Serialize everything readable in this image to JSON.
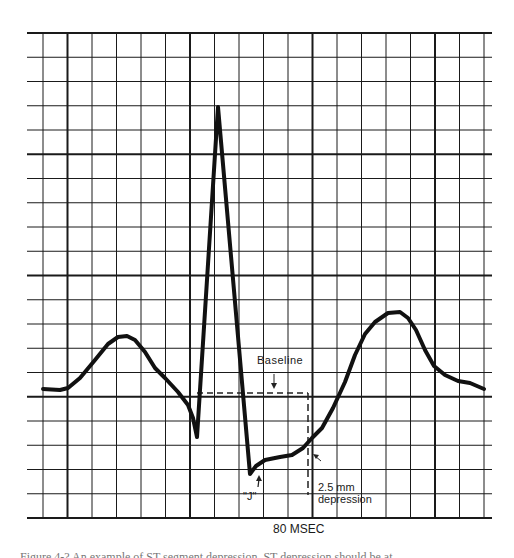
{
  "figure": {
    "labels": {
      "baseline": "Baseline",
      "j_point": "\"J\"",
      "depression_value": "2.5 mm",
      "depression_word": "depression",
      "time_scale": "80 MSEC"
    },
    "caption": "Figure 4-?  An example of ST segment depression.  ST depression should be at"
  },
  "chart_data": {
    "type": "line",
    "xlabel": "80 MSEC (per major division)",
    "ylabel": "",
    "grid": {
      "on": true,
      "minor_spacing_px": 24.4,
      "major_every": 5,
      "x_range_px": [
        43,
        484
      ],
      "y_range_px": [
        33,
        518
      ],
      "hline_extent_px": [
        27,
        492
      ],
      "color": "#1a1a1a"
    },
    "baseline_y_px": 393,
    "trace_units": "pixel coordinates",
    "trace": [
      [
        43,
        389
      ],
      [
        60,
        390
      ],
      [
        68,
        388
      ],
      [
        80,
        378
      ],
      [
        95,
        360
      ],
      [
        108,
        344
      ],
      [
        118,
        337
      ],
      [
        127,
        336
      ],
      [
        135,
        340
      ],
      [
        145,
        352
      ],
      [
        155,
        368
      ],
      [
        165,
        378
      ],
      [
        178,
        392
      ],
      [
        188,
        405
      ],
      [
        193,
        418
      ],
      [
        197,
        437
      ],
      [
        218,
        107
      ],
      [
        250,
        474
      ],
      [
        256,
        466
      ],
      [
        265,
        460
      ],
      [
        280,
        457
      ],
      [
        292,
        455
      ],
      [
        303,
        448
      ],
      [
        312,
        438
      ],
      [
        322,
        428
      ],
      [
        333,
        408
      ],
      [
        345,
        382
      ],
      [
        355,
        355
      ],
      [
        365,
        334
      ],
      [
        375,
        322
      ],
      [
        388,
        313
      ],
      [
        400,
        312
      ],
      [
        408,
        318
      ],
      [
        416,
        330
      ],
      [
        425,
        350
      ],
      [
        434,
        366
      ],
      [
        445,
        375
      ],
      [
        458,
        381
      ],
      [
        470,
        383
      ],
      [
        484,
        389
      ]
    ],
    "annotations": [
      {
        "text": "Baseline",
        "type": "dashed-line",
        "y_px": 393,
        "x_from_px": 197,
        "x_to_px": 308
      },
      {
        "text": "\"J\"",
        "x_px": 252,
        "y_px": 474,
        "arrow": "up"
      },
      {
        "text": "2.5 mm depression",
        "dashed_vertical_x_px": 308,
        "from_y_px": 393,
        "to_y_px": 495,
        "arrow_to": [
          312,
          455
        ]
      },
      {
        "text": "80 MSEC",
        "scale_bar": "one major division"
      }
    ]
  }
}
